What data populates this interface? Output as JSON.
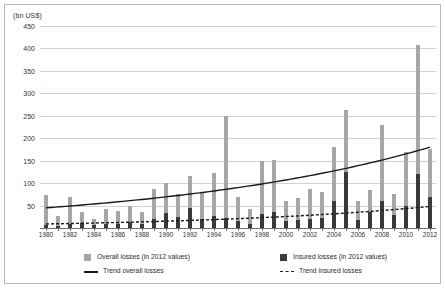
{
  "chart_data": {
    "type": "bar",
    "title": "",
    "subtitle": "",
    "xlabel": "",
    "ylabel": "(bn US$)",
    "ylim": [
      0,
      450
    ],
    "yticks": [
      0,
      50,
      100,
      150,
      200,
      250,
      300,
      350,
      400,
      450
    ],
    "ytick_labels": [
      "",
      "50",
      "100",
      "150",
      "200",
      "250",
      "300",
      "350",
      "400",
      "450"
    ],
    "grid": true,
    "legend_position": "bottom",
    "x": [
      1980,
      1981,
      1982,
      1983,
      1984,
      1985,
      1986,
      1987,
      1988,
      1989,
      1990,
      1991,
      1992,
      1993,
      1994,
      1995,
      1996,
      1997,
      1998,
      1999,
      2000,
      2001,
      2002,
      2003,
      2004,
      2005,
      2006,
      2007,
      2008,
      2009,
      2010,
      2011,
      2012
    ],
    "xtick_labels": [
      "1980",
      "1982",
      "1984",
      "1986",
      "1988",
      "1990",
      "1992",
      "1994",
      "1996",
      "1998",
      "2000",
      "2002",
      "2004",
      "2006",
      "2008",
      "2010",
      "2012"
    ],
    "series": [
      {
        "name": "Overall losses (in 2012 values)",
        "color": "#a6a6a6",
        "values": [
          73,
          26,
          68,
          36,
          20,
          42,
          39,
          50,
          36,
          88,
          100,
          75,
          115,
          77,
          122,
          250,
          68,
          43,
          150,
          152,
          60,
          66,
          88,
          80,
          180,
          262,
          60,
          85,
          230,
          75,
          170,
          408,
          175
        ]
      },
      {
        "name": "Insured losses (in 2012 values)",
        "color": "#3a3a3a",
        "values": [
          7,
          5,
          9,
          11,
          6,
          9,
          8,
          14,
          10,
          20,
          34,
          25,
          44,
          20,
          27,
          22,
          16,
          10,
          31,
          36,
          15,
          17,
          19,
          23,
          60,
          125,
          18,
          36,
          60,
          28,
          50,
          120,
          70
        ]
      }
    ],
    "trends": [
      {
        "name": "Trend overall losses",
        "style": "solid",
        "color": "#1a1a1a",
        "start_year": 1980,
        "end_year": 2012,
        "start_value": 45,
        "end_value": 180,
        "curve": "exponential"
      },
      {
        "name": "Trend insured losses",
        "style": "dashed",
        "color": "#1a1a1a",
        "start_year": 1980,
        "end_year": 2012,
        "start_value": 9,
        "end_value": 48,
        "curve": "exponential"
      }
    ]
  },
  "legend": {
    "items": [
      {
        "label": "Overall losses (in 2012 values)",
        "marker": "square-gray"
      },
      {
        "label": "Insured losses (in 2012 values)",
        "marker": "square-dark"
      },
      {
        "label": "Trend overall losses",
        "marker": "line-solid"
      },
      {
        "label": "Trend insured losses",
        "marker": "line-dashed"
      }
    ]
  }
}
